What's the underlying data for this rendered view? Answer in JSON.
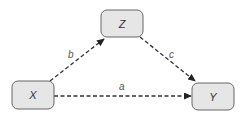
{
  "diagram": {
    "type": "path-diagram",
    "node_fill": "#e6e6e6",
    "node_stroke": "#666666",
    "edge_color": "#333333",
    "nodes": [
      {
        "id": "X",
        "label": "X",
        "x": 12,
        "y": 81,
        "w": 42,
        "h": 28
      },
      {
        "id": "Z",
        "label": "Z",
        "x": 101,
        "y": 10,
        "w": 42,
        "h": 27
      },
      {
        "id": "Y",
        "label": "Y",
        "x": 192,
        "y": 83,
        "w": 42,
        "h": 27
      }
    ],
    "edges": [
      {
        "from": "X",
        "to": "Z",
        "label": "b",
        "style": "dashed"
      },
      {
        "from": "Z",
        "to": "Y",
        "label": "c",
        "style": "dashed"
      },
      {
        "from": "X",
        "to": "Y",
        "label": "a",
        "style": "dashed"
      }
    ]
  }
}
